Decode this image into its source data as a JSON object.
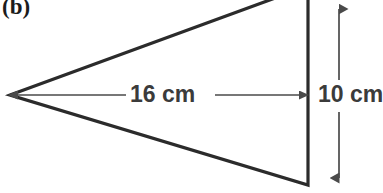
{
  "figure": {
    "panel_label": "(b)",
    "shape": "triangle",
    "stroke_color": "#2b2b2b",
    "dimension_color": "#4a4a4a",
    "text_color": "#3b3b3b",
    "background_color": "#ffffff"
  },
  "dimensions": {
    "base": {
      "label": "16 cm",
      "value": 16,
      "unit": "cm",
      "orientation": "horizontal"
    },
    "height": {
      "label": "10 cm",
      "value": 10,
      "unit": "cm",
      "orientation": "vertical"
    }
  },
  "geometry": {
    "apex_left": [
      10,
      95
    ],
    "top_right": [
      308,
      -12
    ],
    "bottom_right": [
      308,
      185
    ],
    "base_line_y": 95,
    "height_line_x": 339
  }
}
